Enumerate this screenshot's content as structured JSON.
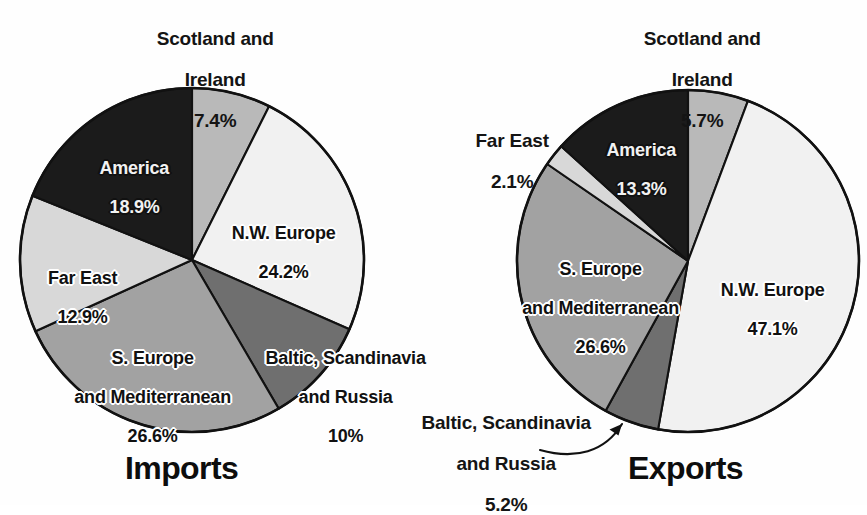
{
  "figure": {
    "background": "#fefefe",
    "outline_color": "#111111"
  },
  "charts": [
    {
      "id": "imports",
      "title": "Imports",
      "type": "pie",
      "center": [
        192,
        260
      ],
      "radius": 172,
      "start_angle_deg": -90,
      "direction": "clockwise",
      "slices": [
        {
          "name": "Scotland and Ireland",
          "label": "Scotland and\nIreland",
          "value_label": "7.4%",
          "value": 7.4,
          "color": "#b9b9b9",
          "placement": "outside"
        },
        {
          "name": "N.W. Europe",
          "label": "N.W. Europe",
          "value_label": "24.2%",
          "value": 24.2,
          "color": "#f1f1f1",
          "placement": "inside"
        },
        {
          "name": "Baltic, Scandinavia and Russia",
          "label": "Baltic, Scandinavia\nand Russia",
          "value_label": "10%",
          "value": 10.0,
          "color": "#6f6f6f",
          "placement": "inside"
        },
        {
          "name": "S. Europe and Mediterranean",
          "label": "S. Europe\nand Mediterranean",
          "value_label": "26.6%",
          "value": 26.6,
          "color": "#a2a2a2",
          "placement": "inside"
        },
        {
          "name": "Far East",
          "label": "Far East",
          "value_label": "12.9%",
          "value": 12.9,
          "color": "#d8d8d8",
          "placement": "inside"
        },
        {
          "name": "America",
          "label": "America",
          "value_label": "18.9%",
          "value": 18.9,
          "color": "#1b1b1b",
          "placement": "inside-dark"
        }
      ]
    },
    {
      "id": "exports",
      "title": "Exports",
      "type": "pie",
      "center": [
        688,
        261
      ],
      "radius": 171,
      "start_angle_deg": -90,
      "direction": "clockwise",
      "slices": [
        {
          "name": "Scotland and Ireland",
          "label": "Scotland and\nIreland",
          "value_label": "5.7%",
          "value": 5.7,
          "color": "#b9b9b9",
          "placement": "outside"
        },
        {
          "name": "N.W. Europe",
          "label": "N.W. Europe",
          "value_label": "47.1%",
          "value": 47.1,
          "color": "#f1f1f1",
          "placement": "inside"
        },
        {
          "name": "Baltic, Scandinavia and Russia",
          "label": "Baltic, Scandinavia\nand Russia",
          "value_label": "5.2%",
          "value": 5.2,
          "color": "#6f6f6f",
          "placement": "outside-leader"
        },
        {
          "name": "S. Europe and Mediterranean",
          "label": "S. Europe\nand Mediterranean",
          "value_label": "26.6%",
          "value": 26.6,
          "color": "#a2a2a2",
          "placement": "inside"
        },
        {
          "name": "Far East",
          "label": "Far East",
          "value_label": "2.1%",
          "value": 2.1,
          "color": "#d8d8d8",
          "placement": "outside"
        },
        {
          "name": "America",
          "label": "America",
          "value_label": "13.3%",
          "value": 13.3,
          "color": "#1b1b1b",
          "placement": "inside-dark"
        }
      ]
    }
  ],
  "chart_data": [
    {
      "type": "pie",
      "title": "Imports",
      "categories": [
        "Scotland and Ireland",
        "N.W. Europe",
        "Baltic, Scandinavia and Russia",
        "S. Europe and Mediterranean",
        "Far East",
        "America"
      ],
      "values": [
        7.4,
        24.2,
        10,
        26.6,
        12.9,
        18.9
      ],
      "value_labels": [
        "7.4%",
        "24.2%",
        "10%",
        "26.6%",
        "12.9%",
        "18.9%"
      ],
      "units": "percent",
      "legend": "none (direct slice labels)",
      "grid": false
    },
    {
      "type": "pie",
      "title": "Exports",
      "categories": [
        "Scotland and Ireland",
        "N.W. Europe",
        "Baltic, Scandinavia and Russia",
        "S. Europe and Mediterranean",
        "Far East",
        "America"
      ],
      "values": [
        5.7,
        47.1,
        5.2,
        26.6,
        2.1,
        13.3
      ],
      "value_labels": [
        "5.7%",
        "47.1%",
        "5.2%",
        "26.6%",
        "2.1%",
        "13.3%"
      ],
      "units": "percent",
      "legend": "none (direct slice labels)",
      "grid": false
    }
  ],
  "labels": {
    "imports": {
      "scotland_name": "Scotland and",
      "scotland_name2": "Ireland",
      "scotland_value": "7.4%",
      "nweurope_name": "N.W. Europe",
      "nweurope_value": "24.2%",
      "baltic_name": "Baltic, Scandinavia",
      "baltic_name2": "and Russia",
      "baltic_value": "10%",
      "seurope_name": "S. Europe",
      "seurope_name2": "and Mediterranean",
      "seurope_value": "26.6%",
      "fareast_name": "Far East",
      "fareast_value": "12.9%",
      "america_name": "America",
      "america_value": "18.9%",
      "title": "Imports"
    },
    "exports": {
      "scotland_name": "Scotland and",
      "scotland_name2": "Ireland",
      "scotland_value": "5.7%",
      "nweurope_name": "N.W. Europe",
      "nweurope_value": "47.1%",
      "baltic_name": "Baltic, Scandinavia",
      "baltic_name2": "and Russia",
      "baltic_value": "5.2%",
      "seurope_name": "S. Europe",
      "seurope_name2": "and Mediterranean",
      "seurope_value": "26.6%",
      "fareast_name": "Far East",
      "fareast_value": "2.1%",
      "america_name": "America",
      "america_value": "13.3%",
      "title": "Exports"
    }
  }
}
